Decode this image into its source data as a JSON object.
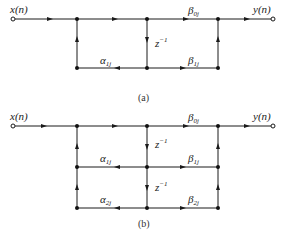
{
  "diagrams": [
    {
      "id": "a",
      "caption": "(a)",
      "input_label": "x(n)",
      "output_label": "y(n)",
      "feedback_coeffs": [
        {
          "base": "α",
          "sub": "1j"
        }
      ],
      "feedforward_coeffs": [
        {
          "base": "β",
          "sub": "0j"
        },
        {
          "base": "β",
          "sub": "1j"
        }
      ],
      "delays": [
        {
          "base": "z",
          "sup": "−1"
        }
      ]
    },
    {
      "id": "b",
      "caption": "(b)",
      "input_label": "x(n)",
      "output_label": "y(n)",
      "feedback_coeffs": [
        {
          "base": "α",
          "sub": "1j"
        },
        {
          "base": "α",
          "sub": "2j"
        }
      ],
      "feedforward_coeffs": [
        {
          "base": "β",
          "sub": "0j"
        },
        {
          "base": "β",
          "sub": "1j"
        },
        {
          "base": "β",
          "sub": "2j"
        }
      ],
      "delays": [
        {
          "base": "z",
          "sup": "−1"
        },
        {
          "base": "z",
          "sup": "−1"
        }
      ]
    }
  ],
  "colors": {
    "line": "#1a1a1a",
    "background": "#ffffff"
  }
}
